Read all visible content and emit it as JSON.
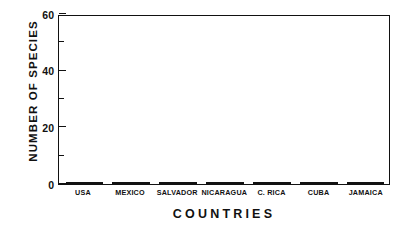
{
  "chart_data": {
    "type": "bar",
    "title": "",
    "subtitle": "",
    "xlabel": "COUNTRIES",
    "ylabel": "NUMBER OF SPECIES",
    "categories": [
      "USA",
      "MEXICO",
      "SALVADOR",
      "NICARAGUA",
      "C. RICA",
      "CUBA",
      "JAMAICA"
    ],
    "values": [
      28,
      57,
      25,
      22,
      36,
      13,
      8
    ],
    "ylim": [
      0,
      60
    ],
    "xlim": [
      0,
      7
    ],
    "ytick_labels": [
      "0",
      "20",
      "40",
      "60"
    ],
    "ytick_values": [
      0,
      20,
      40,
      60
    ],
    "yminor_tick_values": [
      10,
      30,
      50
    ],
    "grid": false,
    "legend": null,
    "legend_position": "none",
    "bar_fill": "diagonal-hatch",
    "bar_edge_color": "#111111",
    "background_color": "#ffffff",
    "annotations": []
  },
  "axes": {
    "y_title": "NUMBER OF SPECIES",
    "x_title": "COUNTRIES"
  }
}
